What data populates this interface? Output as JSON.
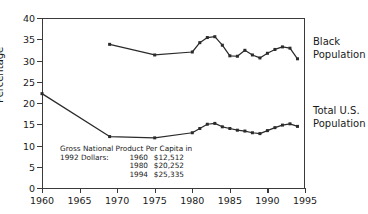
{
  "chart_data": {
    "type": "line",
    "title": "",
    "xlabel": "",
    "ylabel": "Percentage",
    "xlim": [
      1960,
      1995
    ],
    "ylim": [
      0,
      40
    ],
    "xticks": [
      1960,
      1965,
      1970,
      1975,
      1980,
      1985,
      1990,
      1995
    ],
    "yticks": [
      0,
      5,
      10,
      15,
      20,
      25,
      30,
      35,
      40
    ],
    "grid": false,
    "legend_position": "right-of-axes",
    "series": [
      {
        "name": "Black Population",
        "x": [
          1969,
          1975,
          1980,
          1981,
          1982,
          1983,
          1984,
          1985,
          1986,
          1987,
          1988,
          1989,
          1990,
          1991,
          1992,
          1993,
          1994
        ],
        "values": [
          33.8,
          31.3,
          32.0,
          34.2,
          35.4,
          35.6,
          33.6,
          31.1,
          31.0,
          32.4,
          31.3,
          30.6,
          31.7,
          32.6,
          33.2,
          32.9,
          30.4
        ]
      },
      {
        "name": "Total U.S. Population",
        "x": [
          1960,
          1969,
          1975,
          1980,
          1981,
          1982,
          1983,
          1984,
          1985,
          1986,
          1987,
          1988,
          1989,
          1990,
          1991,
          1992,
          1993,
          1994
        ],
        "values": [
          22.2,
          12.1,
          11.8,
          13.0,
          14.0,
          15.0,
          15.2,
          14.4,
          14.0,
          13.6,
          13.4,
          13.0,
          12.8,
          13.5,
          14.2,
          14.8,
          15.1,
          14.5
        ]
      }
    ],
    "annotation": {
      "line1": "Gross National Product Per Capita in",
      "lead": "1992 Dollars:",
      "rows": [
        {
          "year": "1960",
          "amount": "$12,512"
        },
        {
          "year": "1980",
          "amount": "$20,252"
        },
        {
          "year": "1994",
          "amount": "$25,335"
        }
      ]
    },
    "series_labels": {
      "black_line1": "Black",
      "black_line2": "Population",
      "total_line1": "Total U.S.",
      "total_line2": "Population"
    },
    "colors": {
      "line": "#2b2b2b",
      "axis": "#3a3a3a",
      "background": "#ffffff"
    }
  }
}
